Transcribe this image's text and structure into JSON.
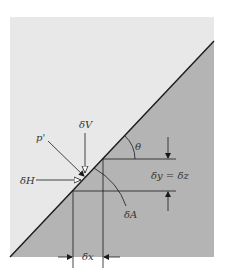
{
  "diagram": {
    "colors": {
      "background": "#ffffff",
      "fluid_region": "#e8e8e8",
      "solid_region": "#b4b4b4",
      "line": "#1a1a1a",
      "text": "#333333"
    },
    "labels": {
      "pressure": "p'",
      "vertical_force": "δV",
      "horizontal_force": "δH",
      "angle": "θ",
      "height": "δy = δz",
      "area": "δA",
      "width": "δx"
    }
  }
}
